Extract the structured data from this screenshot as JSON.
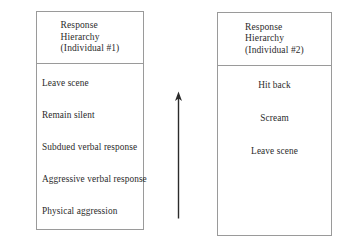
{
  "figure": {
    "background_color": "#ffffff",
    "line_color": "#9a9a9a",
    "text_color": "#2b2b2b"
  },
  "left_panel": {
    "header": "Response\nHierarchy\n(Individual #1)",
    "items": [
      "Leave scene",
      "Remain silent",
      "Subdued verbal response",
      "Aggressive verbal response",
      "Physical aggression"
    ]
  },
  "right_panel": {
    "header": "Response\nHierarchy\n(Individual #2)",
    "items": [
      "Hit back",
      "Scream",
      "Leave scene"
    ]
  },
  "arrow": {
    "direction": "up",
    "label": ""
  }
}
